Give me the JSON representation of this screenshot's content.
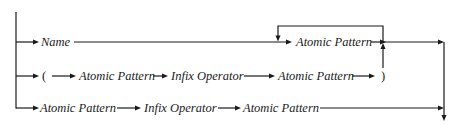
{
  "diagram": {
    "type": "syntax-diagram",
    "rows": [
      {
        "name": "name-row",
        "items": [
          {
            "label": "Name",
            "italic": true
          },
          {
            "label": "Atomic Pattern",
            "italic": true,
            "repeatable": true
          }
        ]
      },
      {
        "name": "parenthesized-row",
        "items": [
          {
            "label": "(",
            "italic": false
          },
          {
            "label": "Atomic Pattern",
            "italic": true
          },
          {
            "label": "Infix Operator",
            "italic": true
          },
          {
            "label": "Atomic Pattern",
            "italic": true
          },
          {
            "label": ")",
            "italic": false
          }
        ]
      },
      {
        "name": "infix-row",
        "items": [
          {
            "label": "Atomic Pattern",
            "italic": true
          },
          {
            "label": "Infix Operator",
            "italic": true
          },
          {
            "label": "Atomic Pattern",
            "italic": true
          }
        ]
      }
    ],
    "colors": {
      "line": "#1a1a1a",
      "background": "#ffffff"
    }
  }
}
